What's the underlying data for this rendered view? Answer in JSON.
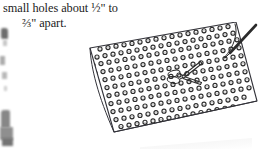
{
  "page": {
    "width": 258,
    "height": 153,
    "background_color": "#ffffff",
    "ink_color": "#1b1b1b"
  },
  "caption": {
    "line1": "small holes about ½\" to",
    "line2": "⅔\" apart.",
    "full_text": "small holes about ½\" to ⅔\" apart.",
    "font_style": "serif",
    "measurements": [
      "½\"",
      "⅔\""
    ]
  },
  "illustration": {
    "name": "perforated-board-with-scissors",
    "description": "Line drawing of a rectangular perforated sheet seen in perspective, covered in a staggered grid of small drilled holes, with a pair of scissors lying on it and a pointed tool at the upper right corner.",
    "stroke_color": "#2a2a2a",
    "fill_color": "#ffffff",
    "board": {
      "name": "perforated-board",
      "hole_count_approx": 190,
      "hole_rows": 11,
      "hole_columns": 18,
      "hole_shape": "small-circle-ring"
    },
    "objects": [
      {
        "name": "scissors",
        "position": "center-right of board"
      },
      {
        "name": "pointer-tool",
        "position": "upper-right corner"
      }
    ]
  },
  "photo_fragment": {
    "name": "page-edge-photo-fragment",
    "description": "Faint grayscale photographic remnant cropped at the left edge of the page.",
    "tone": "grayscale"
  }
}
